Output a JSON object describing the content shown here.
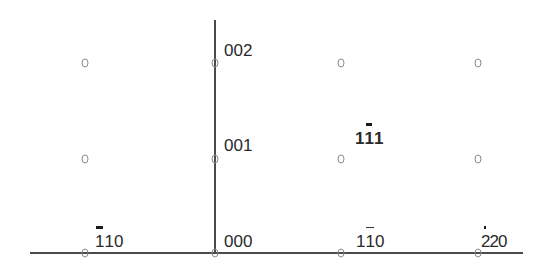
{
  "diagram": {
    "type": "electron-diffraction-pattern",
    "axes": {
      "horizontal": {
        "x1": 30,
        "x2": 523,
        "y": 253
      },
      "vertical": {
        "x": 215,
        "y1": 20,
        "y2": 253
      }
    },
    "spots": [
      {
        "x": 85,
        "y": 63
      },
      {
        "x": 215,
        "y": 63
      },
      {
        "x": 341,
        "y": 63
      },
      {
        "x": 478,
        "y": 63
      },
      {
        "x": 85,
        "y": 159
      },
      {
        "x": 215,
        "y": 159
      },
      {
        "x": 341,
        "y": 159
      },
      {
        "x": 478,
        "y": 159
      },
      {
        "x": 85,
        "y": 253
      },
      {
        "x": 215,
        "y": 253
      },
      {
        "x": 341,
        "y": 253
      },
      {
        "x": 478,
        "y": 253
      }
    ],
    "labels": {
      "l002": {
        "text": "002",
        "chars": [
          "0",
          "0",
          "2"
        ],
        "bar_index": null
      },
      "l001": {
        "text": "001",
        "chars": [
          "0",
          "0",
          "1"
        ],
        "bar_index": null
      },
      "l000": {
        "text": "000",
        "chars": [
          "0",
          "0",
          "0"
        ],
        "bar_index": null
      },
      "lm110": {
        "text": "-110",
        "chars": [
          "1",
          "1",
          "0"
        ],
        "bar_index": 0
      },
      "l1m10": {
        "text": "1-10",
        "chars": [
          "1",
          "1",
          "0"
        ],
        "bar_index": 1
      },
      "lm220": {
        "text": "-220",
        "chars": [
          "2",
          "2",
          "0"
        ],
        "bar_index": 0
      },
      "l1m11": {
        "text": "1-11",
        "chars": [
          "1",
          "1",
          "1"
        ],
        "bar_index": 1
      }
    }
  }
}
